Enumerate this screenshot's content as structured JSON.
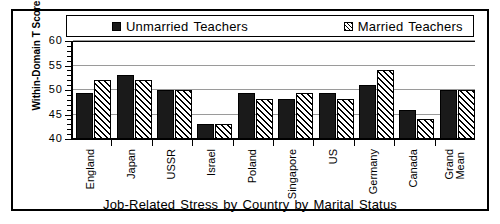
{
  "chart_data": {
    "type": "bar",
    "title": "",
    "xlabel": "Job-Related Stress by Country by Marital Status",
    "ylabel": "Within-Domain T Scores",
    "ylim": [
      40,
      60
    ],
    "yticks": [
      40,
      45,
      50,
      55,
      60
    ],
    "ytick_labels": [
      "40",
      "45",
      "50",
      "55",
      "60"
    ],
    "grid": true,
    "legend_position": "top",
    "categories": [
      "England",
      "Japan",
      "USSR",
      "Israel",
      "Poland",
      "Singapore",
      "US",
      "Germany",
      "Canada",
      "Grand Mean"
    ],
    "series": [
      {
        "name": "Unmarried Teachers",
        "pattern": "solid",
        "color": "#1a1a1a",
        "values": [
          49.3,
          53.0,
          50.0,
          43.0,
          49.3,
          48.2,
          49.3,
          51.0,
          46.0,
          50.0
        ]
      },
      {
        "name": "Married Teachers",
        "pattern": "diagonal-hatch",
        "color": "#ffffff",
        "values": [
          52.0,
          52.0,
          50.0,
          43.0,
          48.2,
          49.3,
          48.2,
          54.0,
          44.0,
          50.0
        ]
      }
    ]
  },
  "legend": {
    "entries": [
      {
        "label_part1": "Unmarried",
        "label_part2": "Teachers"
      },
      {
        "label_part1": "Married",
        "label_part2": "Teachers"
      }
    ]
  },
  "axis_title": {
    "x_words": [
      "Job-Related",
      "Stress",
      "by",
      "Country",
      "by",
      "Marital",
      "Status"
    ],
    "y": "Within-Domain T Scores"
  },
  "category_labels": [
    {
      "line1": "England",
      "line2": ""
    },
    {
      "line1": "Japan",
      "line2": ""
    },
    {
      "line1": "USSR",
      "line2": ""
    },
    {
      "line1": "Israel",
      "line2": ""
    },
    {
      "line1": "Poland",
      "line2": ""
    },
    {
      "line1": "Singapore",
      "line2": ""
    },
    {
      "line1": "US",
      "line2": ""
    },
    {
      "line1": "Germany",
      "line2": ""
    },
    {
      "line1": "Canada",
      "line2": ""
    },
    {
      "line1": "Grand",
      "line2": "Mean"
    }
  ]
}
